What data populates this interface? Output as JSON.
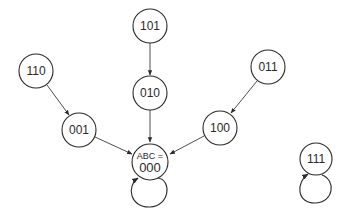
{
  "diagram": {
    "type": "state-transition",
    "nodes": {
      "n101": {
        "label": "101"
      },
      "n010": {
        "label": "010"
      },
      "n110": {
        "label": "110"
      },
      "n011": {
        "label": "011"
      },
      "n001": {
        "label": "001"
      },
      "n100": {
        "label": "100"
      },
      "n000": {
        "prefix": "ABC =",
        "label": "000"
      },
      "n111": {
        "label": "111"
      }
    },
    "edges": [
      {
        "from": "101",
        "to": "010"
      },
      {
        "from": "110",
        "to": "001"
      },
      {
        "from": "011",
        "to": "100"
      },
      {
        "from": "001",
        "to": "000"
      },
      {
        "from": "010",
        "to": "000"
      },
      {
        "from": "100",
        "to": "000"
      },
      {
        "from": "000",
        "to": "000"
      },
      {
        "from": "111",
        "to": "111"
      }
    ]
  }
}
